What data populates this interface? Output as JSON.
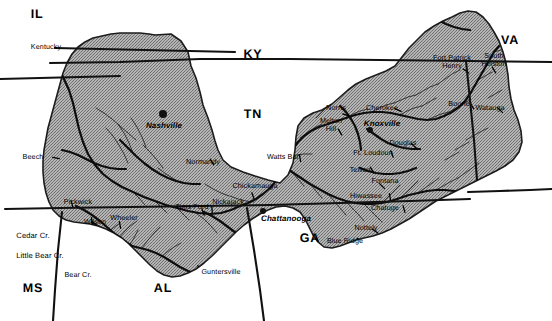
{
  "figure": {
    "kind": "map",
    "region": "Tennessee River Valley",
    "colors": {
      "watershed_fill": "#a9a9a9",
      "watershed_stroke": "#1a1a1a",
      "river": "#161616",
      "state_border": "#111111",
      "background": "#ffffff",
      "label_text": "#000000"
    }
  },
  "states": [
    {
      "id": "IL",
      "label": "IL",
      "x": 37,
      "y": 14
    },
    {
      "id": "KY",
      "label": "KY",
      "x": 253,
      "y": 54
    },
    {
      "id": "VA",
      "label": "VA",
      "x": 510,
      "y": 40
    },
    {
      "id": "TN",
      "label": "TN",
      "x": 253,
      "y": 114
    },
    {
      "id": "GA",
      "label": "GA",
      "x": 310,
      "y": 238
    },
    {
      "id": "AL",
      "label": "AL",
      "x": 163,
      "y": 288
    },
    {
      "id": "MS",
      "label": "MS",
      "x": 33,
      "y": 288
    }
  ],
  "cities": [
    {
      "name": "Nashville",
      "x": 164,
      "y": 126,
      "dot_x": 163,
      "dot_y": 114,
      "dot_size": "lg"
    },
    {
      "name": "Knoxville",
      "x": 382,
      "y": 124,
      "dot_x": 370,
      "dot_y": 130,
      "dot_size": "sm"
    },
    {
      "name": "Chattanooga",
      "x": 286,
      "y": 219,
      "dot_x": 263,
      "dot_y": 211,
      "dot_size": "sm"
    }
  ],
  "dams": [
    {
      "name": "Kentucky",
      "x": 46,
      "y": 47,
      "lines": 1
    },
    {
      "name": "Beech",
      "x": 33,
      "y": 157,
      "lines": 1
    },
    {
      "name": "Pickwick",
      "x": 78,
      "y": 202,
      "lines": 1
    },
    {
      "name": "Wilson",
      "x": 95,
      "y": 222,
      "lines": 1
    },
    {
      "name": "Wheeler",
      "x": 124,
      "y": 218,
      "lines": 1
    },
    {
      "name": "Cedar Cr.",
      "x": 33,
      "y": 236,
      "lines": 1,
      "outside": true
    },
    {
      "name": "Little Bear Cr.",
      "x": 40,
      "y": 256,
      "lines": 1,
      "outside": true
    },
    {
      "name": "Bear Cr.",
      "x": 78,
      "y": 275,
      "lines": 1
    },
    {
      "name": "Guntersville",
      "x": 221,
      "y": 272,
      "lines": 1
    },
    {
      "name": "Tims Ford",
      "x": 192,
      "y": 207,
      "lines": 1
    },
    {
      "name": "Normandy",
      "x": 203,
      "y": 162,
      "lines": 1
    },
    {
      "name": "Nickajack",
      "x": 228,
      "y": 202,
      "lines": 1
    },
    {
      "name": "Chickamauga",
      "x": 255,
      "y": 186,
      "lines": 1
    },
    {
      "name": "Watts Bar",
      "x": 283,
      "y": 157,
      "lines": 1
    },
    {
      "name": "Norris",
      "x": 336,
      "y": 108,
      "lines": 1
    },
    {
      "name": "Melton\nHill",
      "x": 331,
      "y": 125,
      "lines": 2
    },
    {
      "name": "Cherokee",
      "x": 382,
      "y": 108,
      "lines": 1
    },
    {
      "name": "Douglas",
      "x": 403,
      "y": 143,
      "lines": 1
    },
    {
      "name": "Ft. Loudoun",
      "x": 373,
      "y": 153,
      "lines": 1
    },
    {
      "name": "Tellico",
      "x": 360,
      "y": 170,
      "lines": 1
    },
    {
      "name": "Fontana",
      "x": 385,
      "y": 181,
      "lines": 1
    },
    {
      "name": "Hiwassee",
      "x": 366,
      "y": 196,
      "lines": 1
    },
    {
      "name": "Chatuge",
      "x": 385,
      "y": 208,
      "lines": 1
    },
    {
      "name": "Nottely",
      "x": 366,
      "y": 228,
      "lines": 1
    },
    {
      "name": "Blue Ridge",
      "x": 345,
      "y": 241,
      "lines": 1
    },
    {
      "name": "Boone",
      "x": 459,
      "y": 104,
      "lines": 1
    },
    {
      "name": "Watauga",
      "x": 490,
      "y": 108,
      "lines": 1
    },
    {
      "name": "Fort Patrick\nHenry",
      "x": 452,
      "y": 62,
      "lines": 2
    },
    {
      "name": "South\nHolston",
      "x": 494,
      "y": 60,
      "lines": 2
    }
  ],
  "geometry": {
    "watershed_outline": "M155,35 L171,34 L181,41 L188,52 L191,66 L196,78 L200,92 L203,105 L208,118 L212,130 L215,141 L218,150 L223,160 L231,167 L243,172 L255,176 L268,180 L280,183 L288,175 L293,163 L295,150 L296,137 L298,126 L304,118 L313,113 L322,110 L332,104 L340,97 L348,90 L356,84 L366,79 L376,75 L386,71 L395,66 L402,57 L409,48 L417,40 L425,32 L434,26 L443,21 L452,17 L460,13 L468,11 L476,12 L483,17 L489,24 L494,32 L499,41 L503,52 L506,63 L508,75 L509,87 L511,99 L514,110 L518,120 L521,131 L522,142 L519,152 L513,160 L505,166 L496,171 L486,176 L476,181 L466,186 L456,191 L446,196 L436,201 L427,207 L418,213 L409,219 L400,224 L391,229 L382,233 L373,236 L364,238 L356,240 L348,243 L340,246 L332,248 L324,247 L318,242 L313,235 L309,227 L305,219 L300,212 L293,208 L285,206 L276,207 L268,210 L260,214 L252,219 L244,225 L236,232 L228,240 L220,248 L212,256 L204,263 L196,269 L188,273 L180,276 L172,277 L164,275 L157,271 L150,265 L143,258 L136,251 L129,244 L122,238 L114,233 L106,229 L98,226 L90,224 L82,223 L74,222 L66,220 L59,216 L53,210 L49,202 L46,193 L44,183 L43,172 L43,161 L44,150 L46,139 L48,128 L51,117 L54,106 L57,95 L60,84 L63,73 L67,63 L72,54 L78,47 L85,42 L93,38 L102,36 L111,34 L120,33 L130,33 L140,33 L149,34 Z",
    "state_border_lines": [
      "M50,63 L120,62 L200,59 L290,59 L380,60 L470,61 L552,62",
      "M55,48 L100,49 L145,50 L190,51 L235,52",
      "M0,79 L40,78 L80,77 L120,76",
      "M5,209 L60,208 L130,207 L200,206 L270,205 L340,203 L410,201 L470,199",
      "M468,192 L500,191 L530,190 L552,189",
      "M62,212 L58,250 L55,290 L53,321",
      "M247,208 L254,250 L260,290 L264,321",
      "M466,61 L470,100 L474,140 L477,180"
    ],
    "main_rivers": [
      "M42,40 L48,52 L56,64 L63,77 L69,90 L73,103 L76,116 L79,129 L83,142 L88,154 L95,165 L103,174 L112,181 L122,187 L133,192 L144,197 L155,201 L166,205 L177,208 L188,211 L199,213 L210,214 L221,213 L231,210 L240,206 L248,203 L256,199 L263,194 L270,188 L276,181 L281,173 L285,165 L289,157 L293,149 L298,142 L304,136 L311,131 L319,127 L328,124 L337,121 L346,118 L355,115 L364,113 L373,112 L382,112 L391,113 L400,115 L409,117 L418,119 L427,120 L436,119 L444,116 L452,112 L459,107 L465,101 L470,94 L474,87 L478,80 L482,73 L486,66 L490,59 L494,52 L499,46",
      "M284,166 L292,172 L301,178 L310,184 L319,189 L328,194 L337,198 L346,201 L355,203 L364,204 L373,204 L382,203 L391,201 L400,198 L409,195 L418,193 L427,191 L436,190 L445,190 L454,191 L463,192",
      "M39,30 L46,36 L54,40 L62,41 L70,39 L77,35 L82,29 L85,22",
      "M430,16 L438,20 L446,24 L454,27 L462,29 L470,30",
      "M367,129 L374,134 L381,139 L388,143 L396,146 L404,148 L412,149 L420,149",
      "M360,168 L368,171 L376,173 L384,174 L392,174 L400,173 L408,171 L416,168",
      "M340,106 L346,112 L351,119 L355,126 L358,134 L360,142 L361,150",
      "M204,212 L212,216 L220,221 L228,227 L236,233 L244,239 L252,245 L260,250 L268,254",
      "M92,222 L100,228 L108,234 L116,239 L124,243 L132,246 L140,248 L148,250 L156,253 L164,257 L172,262 L180,267 L188,271 L196,274 L204,275 L212,275",
      "M76,206 L84,210 L92,215 L100,221 L108,228 L116,235 L124,241 L132,246",
      "M62,150 L70,152 L78,155 L86,159 L94,163 L102,166 L110,168 L118,169 L126,169",
      "M120,140 L128,148 L136,156 L144,163 L152,169 L160,174 L168,178 L176,181 L184,183 L192,184 L200,184"
    ],
    "tributaries": [
      "M96,108 L104,113 L112,119 L120,126 L128,133 L136,140",
      "M106,128 L113,136 L119,145 L124,154 L128,163",
      "M118,124 L124,133 L129,143 L133,153",
      "M131,118 L137,127 L142,137 L146,147",
      "M143,145 L150,152 L157,160 L163,168",
      "M158,168 L166,174 L174,179 L182,183",
      "M205,184 L213,189 L221,193 L229,196",
      "M230,196 L238,199 L246,201 L254,202",
      "M196,213 L204,219 L211,226 L217,233",
      "M160,258 L167,252 L174,247 L181,243",
      "M142,248 L148,240 L154,233 L160,227",
      "M129,246 L134,238 L138,230",
      "M118,239 L124,232 L130,226 L137,221",
      "M107,234 L113,228 L120,223",
      "M88,227 L94,233 L100,239 L106,246",
      "M78,224 L84,231 L89,239",
      "M74,222 L79,230 L83,239 L86,248",
      "M262,170 L270,166 L278,163 L286,161",
      "M288,157 L296,155 L304,154 L312,154",
      "M300,138 L307,133 L314,128 L322,124",
      "M316,118 L322,112 L328,106 L334,100",
      "M346,118 L353,114 L360,111 L368,109",
      "M372,112 L379,108 L386,105 L394,103",
      "M394,103 L401,100 L408,97 L416,95",
      "M416,95 L423,91 L430,87 L438,84",
      "M438,84 L445,79 L452,74 L460,70",
      "M400,115 L407,111 L414,108 L422,106",
      "M422,106 L429,102 L436,98",
      "M427,120 L434,117 L441,114 L449,112",
      "M449,112 L456,108 L463,104 L470,100",
      "M436,190 L443,186 L450,182 L458,178",
      "M458,178 L465,173 L472,168 L479,163",
      "M418,193 L425,188 L432,183 L439,178",
      "M400,198 L406,193 L412,187 L418,181",
      "M382,203 L388,197 L394,191 L400,185",
      "M364,204 L370,210 L376,216 L382,222",
      "M346,201 L352,208 L358,214 L364,221",
      "M328,194 L334,201 L340,208 L346,215",
      "M310,184 L316,191 L322,198",
      "M292,172 L298,179 L304,186",
      "M466,140 L473,136 L480,132 L488,128",
      "M455,150 L462,146 L469,142",
      "M445,160 L452,156 L459,152",
      "M488,98 L495,94 L502,90",
      "M478,80 L485,76 L492,72",
      "M494,52 L501,50 L508,49",
      "M133,192 L139,198 L145,205",
      "M155,201 L161,207 L167,213",
      "M177,208 L183,214 L189,220"
    ],
    "dam_ticks": [
      {
        "x": 54,
        "y": 45,
        "a": 40
      },
      {
        "x": 56,
        "y": 158,
        "a": 10
      },
      {
        "x": 72,
        "y": 204,
        "a": 75
      },
      {
        "x": 92,
        "y": 221,
        "a": 80
      },
      {
        "x": 120,
        "y": 225,
        "a": 80
      },
      {
        "x": 86,
        "y": 271,
        "a": 30
      },
      {
        "x": 200,
        "y": 268,
        "a": 45
      },
      {
        "x": 212,
        "y": 209,
        "a": 85
      },
      {
        "x": 253,
        "y": 196,
        "a": 70
      },
      {
        "x": 300,
        "y": 158,
        "a": 80
      },
      {
        "x": 346,
        "y": 115,
        "a": 20
      },
      {
        "x": 340,
        "y": 132,
        "a": 60
      },
      {
        "x": 398,
        "y": 110,
        "a": 25
      },
      {
        "x": 414,
        "y": 146,
        "a": 40
      },
      {
        "x": 392,
        "y": 154,
        "a": 70
      },
      {
        "x": 372,
        "y": 170,
        "a": 60
      },
      {
        "x": 382,
        "y": 186,
        "a": 45
      },
      {
        "x": 390,
        "y": 197,
        "a": 80
      },
      {
        "x": 404,
        "y": 209,
        "a": 75
      },
      {
        "x": 375,
        "y": 231,
        "a": 35
      },
      {
        "x": 360,
        "y": 240,
        "a": 30
      },
      {
        "x": 472,
        "y": 106,
        "a": 60
      },
      {
        "x": 500,
        "y": 110,
        "a": 45
      },
      {
        "x": 466,
        "y": 71,
        "a": 35
      },
      {
        "x": 494,
        "y": 70,
        "a": 60
      },
      {
        "x": 212,
        "y": 162,
        "a": 60
      },
      {
        "x": 203,
        "y": 212,
        "a": 70
      }
    ]
  }
}
